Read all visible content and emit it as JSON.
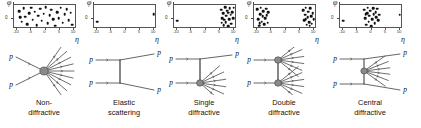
{
  "figure": {
    "axes": {
      "y_axis_label": "φ",
      "y_zero_tick": "0",
      "x_axis_label": "η",
      "x_ticks": [
        "-10",
        "-5",
        "0",
        "5",
        "10"
      ],
      "x_tick_values": [
        -10,
        -5,
        0,
        5,
        10
      ],
      "x_range": [
        -11,
        11
      ],
      "y_range": [
        0,
        1
      ]
    },
    "particle_label": "p",
    "panels": [
      {
        "id": "non-diffractive",
        "caption_line1": "Non-",
        "caption_line2": "diffractive",
        "chart_data": {
          "type": "scatter",
          "title": "Non-diffractive",
          "xlabel": "η",
          "ylabel": "φ",
          "xlim": [
            -11,
            11
          ],
          "ylim": [
            0,
            1
          ],
          "grid": false,
          "points": [
            [
              -9.2,
              0.74
            ],
            [
              -8.3,
              0.3
            ],
            [
              -7.6,
              0.86
            ],
            [
              -7.0,
              0.52
            ],
            [
              -6.3,
              0.2
            ],
            [
              -5.7,
              0.66
            ],
            [
              -5.0,
              0.88
            ],
            [
              -4.4,
              0.38
            ],
            [
              -3.8,
              0.72
            ],
            [
              -3.1,
              0.16
            ],
            [
              -2.5,
              0.56
            ],
            [
              -1.9,
              0.84
            ],
            [
              -1.3,
              0.34
            ],
            [
              -0.6,
              0.64
            ],
            [
              0.1,
              0.9
            ],
            [
              0.7,
              0.24
            ],
            [
              1.4,
              0.58
            ],
            [
              2.0,
              0.8
            ],
            [
              2.7,
              0.4
            ],
            [
              3.3,
              0.14
            ],
            [
              4.0,
              0.7
            ],
            [
              4.6,
              0.46
            ],
            [
              5.3,
              0.88
            ],
            [
              6.0,
              0.26
            ],
            [
              6.7,
              0.62
            ],
            [
              7.4,
              0.82
            ],
            [
              8.1,
              0.36
            ],
            [
              8.8,
              0.68
            ],
            [
              9.4,
              0.18
            ],
            [
              -8.9,
              0.48
            ]
          ]
        },
        "diagram": {
          "type": "non-diffractive",
          "blobs": 1,
          "incoming_labels": [
            "p",
            "p"
          ],
          "outgoing_labels": []
        }
      },
      {
        "id": "elastic-scattering",
        "caption_line1": "Elastic",
        "caption_line2": "scattering",
        "chart_data": {
          "type": "scatter",
          "title": "Elastic scattering",
          "xlabel": "η",
          "ylabel": "φ",
          "xlim": [
            -11,
            11
          ],
          "ylim": [
            0,
            1
          ],
          "grid": false,
          "points": [
            [
              -9.8,
              0.3
            ],
            [
              9.8,
              0.62
            ]
          ]
        },
        "diagram": {
          "type": "elastic",
          "blobs": 0,
          "incoming_labels": [
            "p",
            "p"
          ],
          "outgoing_labels": [
            "p",
            "p"
          ]
        }
      },
      {
        "id": "single-diffractive",
        "caption_line1": "Single",
        "caption_line2": "diffractive",
        "chart_data": {
          "type": "scatter",
          "title": "Single diffractive",
          "xlabel": "η",
          "ylabel": "φ",
          "xlim": [
            -11,
            11
          ],
          "ylim": [
            0,
            1
          ],
          "grid": false,
          "points": [
            [
              -9.8,
              0.34
            ],
            [
              5.4,
              0.8
            ],
            [
              5.9,
              0.44
            ],
            [
              6.3,
              0.16
            ],
            [
              6.1,
              0.66
            ],
            [
              6.8,
              0.9
            ],
            [
              7.0,
              0.28
            ],
            [
              7.3,
              0.56
            ],
            [
              7.6,
              0.76
            ],
            [
              7.9,
              0.12
            ],
            [
              8.2,
              0.4
            ],
            [
              8.5,
              0.86
            ],
            [
              8.8,
              0.6
            ],
            [
              9.0,
              0.22
            ],
            [
              9.3,
              0.7
            ],
            [
              9.6,
              0.46
            ],
            [
              9.8,
              0.88
            ],
            [
              5.7,
              0.26
            ],
            [
              8.0,
              0.68
            ],
            [
              6.5,
              0.38
            ]
          ]
        },
        "diagram": {
          "type": "single-diffractive",
          "blobs": 1,
          "incoming_labels": [
            "p",
            "p"
          ],
          "outgoing_labels": [
            "p"
          ]
        }
      },
      {
        "id": "double-diffractive",
        "caption_line1": "Double",
        "caption_line2": "diffractive",
        "chart_data": {
          "type": "scatter",
          "title": "Double diffractive",
          "xlabel": "η",
          "ylabel": "φ",
          "xlim": [
            -11,
            11
          ],
          "ylim": [
            0,
            1
          ],
          "grid": false,
          "points": [
            [
              -9.8,
              0.82
            ],
            [
              -9.5,
              0.4
            ],
            [
              -9.2,
              0.14
            ],
            [
              -8.9,
              0.62
            ],
            [
              -8.6,
              0.88
            ],
            [
              -8.3,
              0.3
            ],
            [
              -8.0,
              0.54
            ],
            [
              -7.7,
              0.74
            ],
            [
              -7.4,
              0.2
            ],
            [
              -7.1,
              0.46
            ],
            [
              -6.8,
              0.84
            ],
            [
              -6.5,
              0.58
            ],
            [
              -6.2,
              0.26
            ],
            [
              -6.0,
              0.7
            ],
            [
              -9.0,
              0.24
            ],
            [
              6.2,
              0.78
            ],
            [
              6.5,
              0.36
            ],
            [
              6.8,
              0.6
            ],
            [
              7.1,
              0.88
            ],
            [
              7.4,
              0.18
            ],
            [
              7.7,
              0.48
            ],
            [
              8.0,
              0.72
            ],
            [
              8.3,
              0.28
            ],
            [
              8.6,
              0.86
            ],
            [
              8.9,
              0.54
            ],
            [
              9.2,
              0.22
            ],
            [
              9.5,
              0.66
            ],
            [
              9.8,
              0.42
            ],
            [
              7.0,
              0.4
            ],
            [
              8.4,
              0.14
            ]
          ]
        },
        "diagram": {
          "type": "double-diffractive",
          "blobs": 2,
          "incoming_labels": [
            "p",
            "p"
          ],
          "outgoing_labels": []
        }
      },
      {
        "id": "central-diffractive",
        "caption_line1": "Central",
        "caption_line2": "diffractive",
        "chart_data": {
          "type": "scatter",
          "title": "Central diffractive",
          "xlabel": "η",
          "ylabel": "φ",
          "xlim": [
            -11,
            11
          ],
          "ylim": [
            0,
            1
          ],
          "grid": false,
          "points": [
            [
              -9.8,
              0.34
            ],
            [
              -2.6,
              0.8
            ],
            [
              -2.2,
              0.46
            ],
            [
              -1.9,
              0.18
            ],
            [
              -1.6,
              0.66
            ],
            [
              -1.3,
              0.88
            ],
            [
              -1.0,
              0.3
            ],
            [
              -0.7,
              0.56
            ],
            [
              -0.4,
              0.76
            ],
            [
              -0.1,
              0.12
            ],
            [
              0.2,
              0.42
            ],
            [
              0.5,
              0.86
            ],
            [
              0.8,
              0.62
            ],
            [
              1.1,
              0.24
            ],
            [
              1.4,
              0.7
            ],
            [
              1.7,
              0.48
            ],
            [
              2.0,
              0.84
            ],
            [
              2.3,
              0.36
            ],
            [
              2.6,
              0.6
            ],
            [
              -2.0,
              0.62
            ],
            [
              9.8,
              0.6
            ]
          ]
        },
        "diagram": {
          "type": "central-diffractive",
          "blobs": 1,
          "incoming_labels": [
            "p",
            "p"
          ],
          "outgoing_labels": [
            "p",
            "p"
          ]
        }
      }
    ]
  },
  "colors": {
    "background": "#ffffff",
    "axis": "#555555",
    "dot": "#111111",
    "line": "#555555",
    "blob_fill": "#8a8a8a",
    "blob_stroke": "#444444",
    "text": "#111111"
  }
}
